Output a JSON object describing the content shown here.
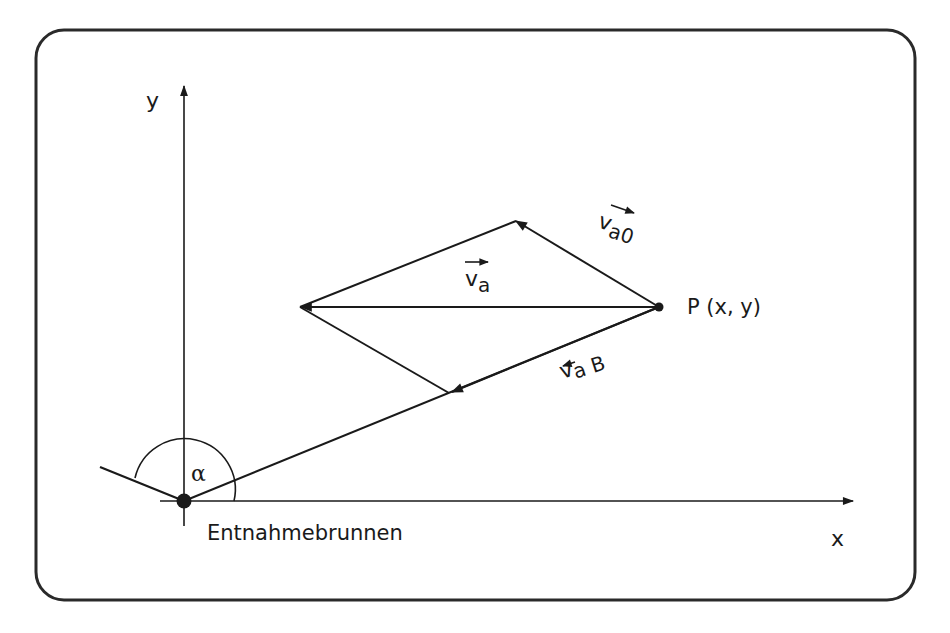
{
  "diagram": {
    "type": "vector-diagram",
    "axes": {
      "x_label": "x",
      "y_label": "y"
    },
    "origin_label": "Entnahmebrunnen",
    "angle_label": "α",
    "point_label": "P (x, y)",
    "vectors": [
      {
        "id": "va",
        "label_base": "v",
        "label_sub": "a",
        "description": "resultant velocity"
      },
      {
        "id": "va0",
        "label_base": "v",
        "label_sub": "a0",
        "description": "velocity component"
      },
      {
        "id": "vaB",
        "label_base": "v",
        "label_sub": "aB",
        "description": "well-induced velocity"
      }
    ],
    "colors": {
      "stroke": "#1a1a1a",
      "background": "#ffffff",
      "frame": "#2a2a2a"
    }
  }
}
